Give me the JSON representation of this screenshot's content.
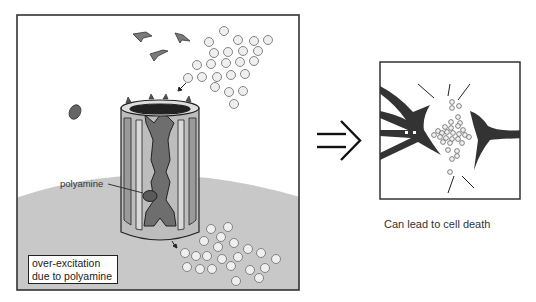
{
  "left_panel": {
    "labels": {
      "polyamine": "polyamine",
      "box_line1": "over-excitation",
      "box_line2": "due to polyamine"
    },
    "colors": {
      "frame": "#333333",
      "membrane": "#c8c8c8",
      "channel_light": "#d4d4d4",
      "channel_mid": "#a0a0a0",
      "channel_dark": "#6e6e6e",
      "ion_fill": "#efefef",
      "ion_stroke": "#777777",
      "polyamine_fill": "#666666"
    }
  },
  "arrow": {
    "symbol": "implies-arrow"
  },
  "right_panel": {
    "caption": "Can lead to cell death",
    "colors": {
      "neuron": "#333333",
      "frame": "#333333"
    }
  }
}
